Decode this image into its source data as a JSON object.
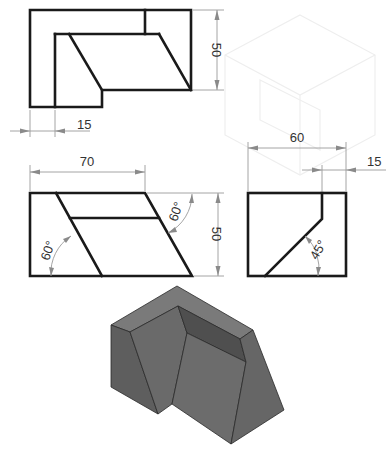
{
  "drawing": {
    "type": "orthographic-projection-exercise",
    "views": {
      "top_view": {
        "dimensions": [
          {
            "label": "50",
            "orientation": "vertical"
          },
          {
            "label": "15",
            "orientation": "horizontal"
          }
        ]
      },
      "front_view": {
        "dimensions": [
          {
            "label": "70",
            "orientation": "horizontal"
          },
          {
            "label": "50",
            "orientation": "vertical"
          }
        ],
        "angles": [
          {
            "label": "60°",
            "position": "left"
          },
          {
            "label": "60°",
            "position": "right"
          }
        ]
      },
      "side_view": {
        "dimensions": [
          {
            "label": "60",
            "orientation": "horizontal"
          },
          {
            "label": "15",
            "orientation": "horizontal"
          }
        ],
        "angles": [
          {
            "label": "45°",
            "position": "bottom"
          }
        ]
      },
      "isometric_view": {
        "shading": "grey-solid",
        "colors": {
          "top": "#7a7a7a",
          "left": "#5e5e5e",
          "front": "#6c6c6c",
          "recess": "#4f4f4f",
          "right": "#666666"
        }
      }
    },
    "colors": {
      "object_line": "#1a1a1a",
      "dimension_line": "#9a9a9a",
      "text": "#333333",
      "background": "#ffffff"
    }
  }
}
